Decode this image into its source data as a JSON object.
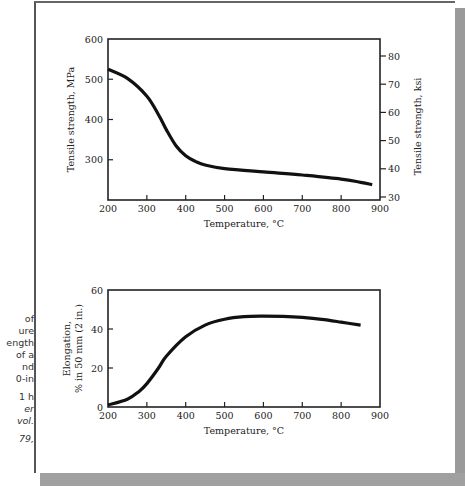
{
  "caption_fragments": {
    "lines": [
      "of",
      "ure",
      "ength",
      "of a",
      "nd",
      "0-in",
      "",
      "1 h",
      "er",
      "vol.",
      "",
      "79,"
    ],
    "italic_from_index": 8
  },
  "chart_data": [
    {
      "type": "line",
      "title": "",
      "xlabel": "Temperature, °C",
      "ylabel": "Tensile strength, MPa",
      "ylabel_right": "Tensile strength, ksi",
      "x_ticks": [
        200,
        300,
        400,
        500,
        600,
        700,
        800,
        900
      ],
      "y_ticks": [
        300,
        400,
        500,
        600
      ],
      "y_right_ticks": [
        30,
        40,
        50,
        60,
        70,
        80
      ],
      "xlim": [
        200,
        900
      ],
      "ylim": [
        200,
        600
      ],
      "grid": false,
      "series": [
        {
          "name": "Tensile strength",
          "x": [
            200,
            250,
            300,
            330,
            350,
            375,
            400,
            425,
            450,
            500,
            600,
            700,
            800,
            850,
            880
          ],
          "values": [
            525,
            502,
            458,
            412,
            375,
            335,
            310,
            296,
            287,
            278,
            270,
            262,
            252,
            244,
            238
          ]
        }
      ]
    },
    {
      "type": "line",
      "title": "",
      "xlabel": "Temperature, °C",
      "ylabel": "Elongation, % in 50 mm (2 in.)",
      "x_ticks": [
        200,
        300,
        400,
        500,
        600,
        700,
        800,
        900
      ],
      "y_ticks": [
        0,
        20,
        40,
        60
      ],
      "xlim": [
        200,
        900
      ],
      "ylim": [
        0,
        60
      ],
      "grid": false,
      "series": [
        {
          "name": "Elongation",
          "x": [
            200,
            250,
            280,
            300,
            330,
            350,
            400,
            450,
            500,
            550,
            600,
            650,
            700,
            750,
            800,
            850
          ],
          "values": [
            1,
            4,
            8,
            12,
            20,
            26,
            36,
            42,
            45,
            46.3,
            46.6,
            46.5,
            46,
            45,
            43.5,
            42
          ]
        }
      ]
    }
  ],
  "layout": {
    "top": {
      "left": 108,
      "right": 380,
      "top": 39,
      "bottom": 200,
      "ymin": 200,
      "ymax": 600,
      "rightTop": 56,
      "rightBottom": 197,
      "rmin": 30,
      "rmax": 80
    },
    "bottom": {
      "left": 108,
      "right": 380,
      "top": 290,
      "bottom": 407,
      "ymin": 0,
      "ymax": 60
    }
  },
  "colors": {
    "line": "#111111",
    "axis": "#222222",
    "shadow": "#9a9a9a"
  }
}
